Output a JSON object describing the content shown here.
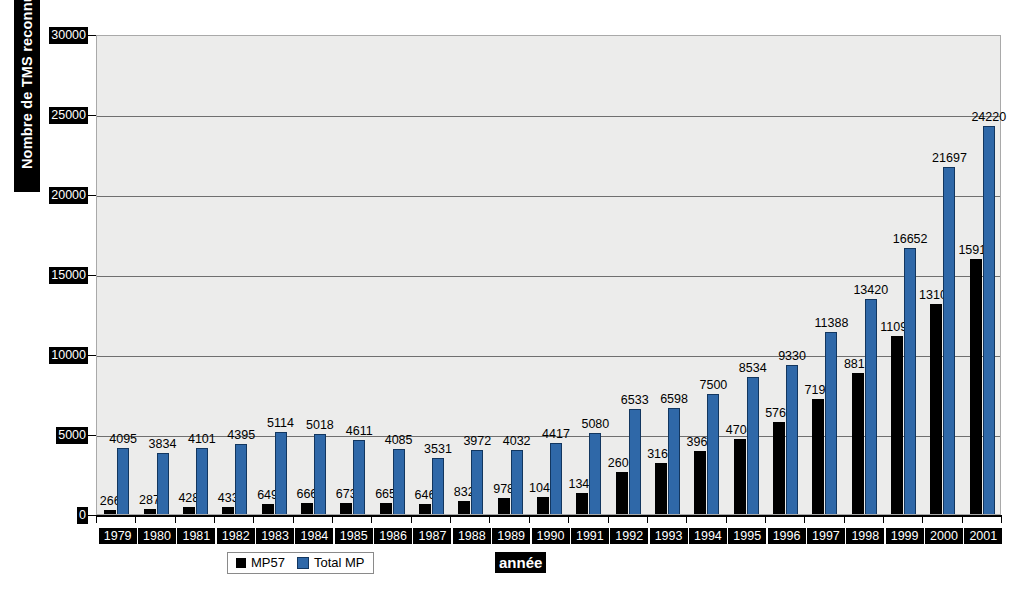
{
  "chart_data": {
    "type": "bar",
    "title": "",
    "xlabel": "année",
    "ylabel": "Nombre de TMS reconnus",
    "ylim": [
      0,
      30000
    ],
    "ytick_labels": [
      "30000",
      "25000",
      "20000",
      "15000",
      "10000",
      "5000",
      "0"
    ],
    "yticks": [
      30000,
      25000,
      20000,
      15000,
      10000,
      5000,
      0
    ],
    "grid": true,
    "legend_position": "bottom-center",
    "categories": [
      "1979",
      "1980",
      "1981",
      "1982",
      "1983",
      "1984",
      "1985",
      "1986",
      "1987",
      "1988",
      "1989",
      "1990",
      "1991",
      "1992",
      "1993",
      "1994",
      "1995",
      "1996",
      "1997",
      "1998",
      "1999",
      "2000",
      "2001"
    ],
    "series": [
      {
        "name": "MP57",
        "color": "#000000",
        "values": [
          266,
          287,
          428,
          433,
          649,
          666,
          673,
          665,
          646,
          832,
          978,
          1040,
          1342,
          2602,
          3165,
          3963,
          4704,
          5767,
          7195,
          8815,
          11095,
          13104,
          15912
        ]
      },
      {
        "name": "Total MP",
        "color": "#2f68a8",
        "values": [
          4095,
          3834,
          4101,
          4395,
          5114,
          5018,
          4611,
          4085,
          3531,
          3972,
          4032,
          4417,
          5080,
          6533,
          6598,
          7500,
          8534,
          9330,
          11388,
          13420,
          16652,
          21697,
          24220
        ]
      }
    ]
  },
  "legend": {
    "entries": [
      {
        "label": "MP57",
        "color": "#000000"
      },
      {
        "label": "Total MP",
        "color": "#2f68a8"
      }
    ]
  },
  "axes": {
    "y_title": "Nombre de TMS reconnus",
    "x_title": "année"
  },
  "colors": {
    "plot_background": "#ececeb",
    "gridline": "#6f6f6f",
    "axis": "#000000",
    "series_mp57": "#000000",
    "series_total_mp": "#2f68a8",
    "tick_label_bg": "#000000",
    "tick_label_fg": "#ffffff"
  }
}
